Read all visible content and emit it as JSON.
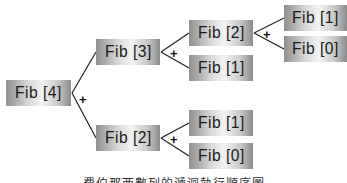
{
  "diagram": {
    "type": "recursion-tree",
    "nodes": [
      {
        "id": "n4",
        "label": "Fib [4]"
      },
      {
        "id": "n3",
        "label": "Fib [3]"
      },
      {
        "id": "n2a",
        "label": "Fib [2]"
      },
      {
        "id": "n1a",
        "label": "Fib [1]"
      },
      {
        "id": "n0a",
        "label": "Fib [0]"
      },
      {
        "id": "n1b",
        "label": "Fib [1]"
      },
      {
        "id": "n2b",
        "label": "Fib [2]"
      },
      {
        "id": "n1c",
        "label": "Fib [1]"
      },
      {
        "id": "n0c",
        "label": "Fib [0]"
      }
    ],
    "edges": [
      [
        "n4",
        "n3"
      ],
      [
        "n4",
        "n2b"
      ],
      [
        "n3",
        "n2a"
      ],
      [
        "n3",
        "n1b"
      ],
      [
        "n2a",
        "n1a"
      ],
      [
        "n2a",
        "n0a"
      ],
      [
        "n2b",
        "n1c"
      ],
      [
        "n2b",
        "n0c"
      ]
    ],
    "operator": "+",
    "caption": "費伯那西數列的遞迴執行順序圖"
  }
}
